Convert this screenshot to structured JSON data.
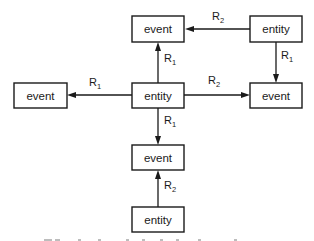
{
  "diagram": {
    "nodes": [
      {
        "id": "event_top",
        "label": "event",
        "type": "event"
      },
      {
        "id": "entity_topright",
        "label": "entity",
        "type": "entity"
      },
      {
        "id": "event_left",
        "label": "event",
        "type": "event"
      },
      {
        "id": "entity_center",
        "label": "entity",
        "type": "entity"
      },
      {
        "id": "event_right",
        "label": "event",
        "type": "event"
      },
      {
        "id": "event_middle",
        "label": "event",
        "type": "event"
      },
      {
        "id": "entity_bottom",
        "label": "entity",
        "type": "entity"
      }
    ],
    "edges": [
      {
        "from": "entity_topright",
        "to": "event_top",
        "relation": "R",
        "sub": "2"
      },
      {
        "from": "entity_topright",
        "to": "event_right",
        "relation": "R",
        "sub": "1"
      },
      {
        "from": "entity_center",
        "to": "event_top",
        "relation": "R",
        "sub": "1"
      },
      {
        "from": "entity_center",
        "to": "event_left",
        "relation": "R",
        "sub": "1"
      },
      {
        "from": "entity_center",
        "to": "event_right",
        "relation": "R",
        "sub": "2"
      },
      {
        "from": "entity_center",
        "to": "event_middle",
        "relation": "R",
        "sub": "1"
      },
      {
        "from": "entity_bottom",
        "to": "event_middle",
        "relation": "R",
        "sub": "2"
      }
    ]
  }
}
